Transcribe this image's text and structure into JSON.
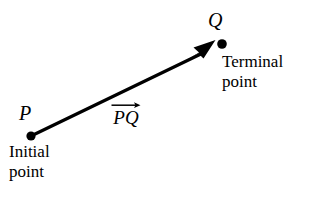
{
  "figure": {
    "type": "vector-diagram",
    "background_color": "#ffffff",
    "stroke_color": "#000000",
    "width": 309,
    "height": 205,
    "labels": {
      "initial_point_symbol": "P",
      "terminal_point_symbol": "Q",
      "initial_point_caption_line1": "Initial",
      "initial_point_caption_line2": "point",
      "terminal_point_caption_line1": "Terminal",
      "terminal_point_caption_line2": "point",
      "vector_notation": "PQ"
    },
    "geometry": {
      "initial_point": {
        "x": 31,
        "y": 136
      },
      "terminal_point": {
        "x": 222,
        "y": 44
      },
      "arrow_tip": {
        "x": 214,
        "y": 41
      },
      "dot_radius": 4.5,
      "line_width": 3
    }
  }
}
